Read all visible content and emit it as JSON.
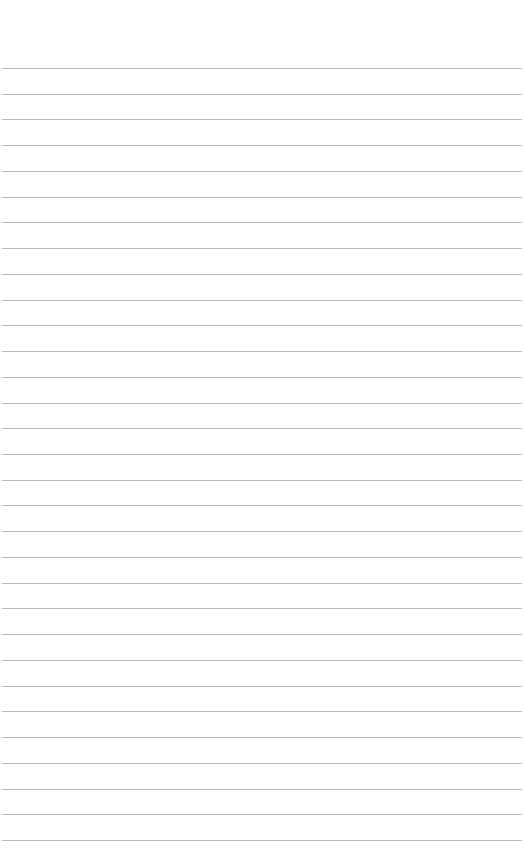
{
  "document": {
    "type": "lined-paper",
    "line_count": 31,
    "line_color": "#b8b8b8",
    "background_color": "#ffffff",
    "text": ""
  }
}
